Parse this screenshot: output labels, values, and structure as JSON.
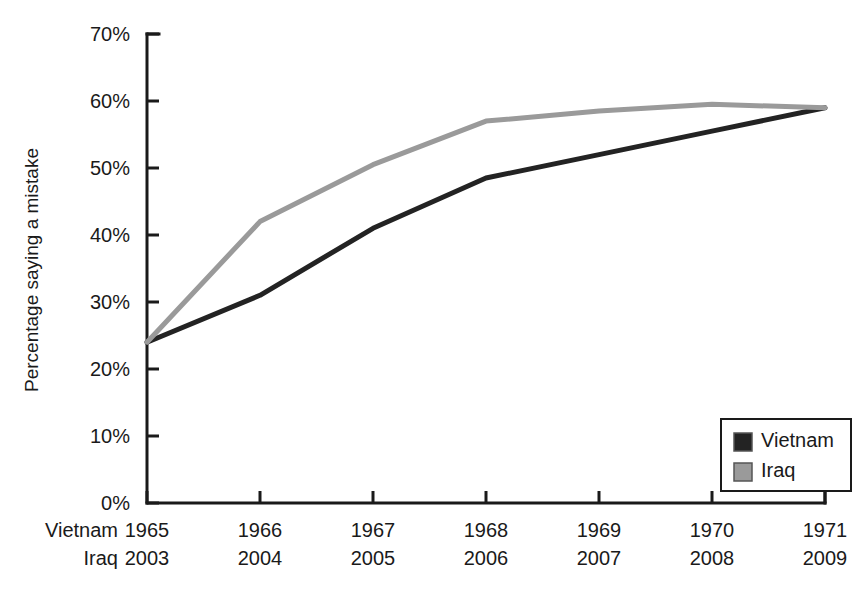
{
  "chart_data": {
    "type": "line",
    "title": "",
    "xlabel": "",
    "ylabel": "Percentage saying a mistake",
    "ylim": [
      0,
      70
    ],
    "grid": false,
    "legend_position": "bottom-right",
    "y_ticks": [
      "0%",
      "10%",
      "20%",
      "30%",
      "40%",
      "50%",
      "60%",
      "70%"
    ],
    "y_tick_values": [
      0,
      10,
      20,
      30,
      40,
      50,
      60,
      70
    ],
    "x_axis_rows": [
      {
        "header": "Vietnam",
        "ticks": [
          "1965",
          "1966",
          "1967",
          "1968",
          "1969",
          "1970",
          "1971"
        ]
      },
      {
        "header": "Iraq",
        "ticks": [
          "2003",
          "2004",
          "2005",
          "2006",
          "2007",
          "2008",
          "2009"
        ]
      }
    ],
    "categories": [
      "1965 / 2003",
      "1966 / 2004",
      "1967 / 2005",
      "1968 / 2006",
      "1969 / 2007",
      "1970 / 2008",
      "1971 / 2009"
    ],
    "series": [
      {
        "name": "Vietnam",
        "color": "#232323",
        "values": [
          24,
          31,
          41,
          48.5,
          52,
          55.5,
          59
        ]
      },
      {
        "name": "Iraq",
        "color": "#9a9a9a",
        "values": [
          24,
          42,
          50.5,
          57,
          58.5,
          59.5,
          59
        ]
      }
    ]
  },
  "legend": {
    "items": [
      {
        "label": "Vietnam",
        "color": "#232323"
      },
      {
        "label": "Iraq",
        "color": "#9a9a9a"
      }
    ]
  },
  "axis": {
    "y_title": "Percentage saying a mistake"
  }
}
